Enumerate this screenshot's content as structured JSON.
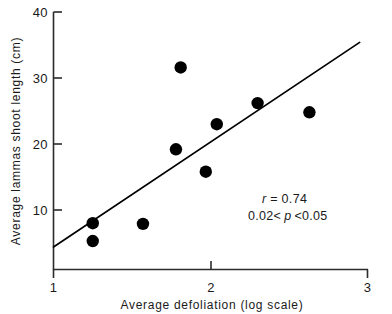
{
  "chart_data": {
    "type": "scatter",
    "title": "",
    "subtitle": "",
    "xlabel": "Average  defoliation  (log  scale)",
    "ylabel": "Average lammas shoot length (cm)",
    "xlim": [
      1,
      3
    ],
    "ylim": [
      0.9,
      40
    ],
    "xticks": [
      "1",
      "2",
      "3"
    ],
    "xtick_values": [
      1,
      2,
      3
    ],
    "yticks": [
      "40",
      "30",
      "20",
      "10"
    ],
    "ytick_values": [
      40,
      30,
      20,
      10
    ],
    "grid": false,
    "legend": null,
    "x_scale_note": "log scale",
    "points": [
      {
        "x": 1.25,
        "y": 8.0
      },
      {
        "x": 1.25,
        "y": 5.3
      },
      {
        "x": 1.57,
        "y": 7.9
      },
      {
        "x": 1.81,
        "y": 31.6
      },
      {
        "x": 1.78,
        "y": 19.2
      },
      {
        "x": 1.97,
        "y": 15.8
      },
      {
        "x": 2.04,
        "y": 23.0
      },
      {
        "x": 2.3,
        "y": 26.2
      },
      {
        "x": 2.63,
        "y": 24.8
      }
    ],
    "series": [
      {
        "name": "observations",
        "marker": "filled-circle",
        "color": "#000000",
        "values": [
          8.0,
          5.3,
          7.9,
          31.6,
          19.2,
          15.8,
          23.0,
          26.2,
          24.8
        ],
        "x": [
          1.25,
          1.25,
          1.57,
          1.81,
          1.78,
          1.97,
          2.04,
          2.3,
          2.63
        ]
      },
      {
        "name": "regression-line",
        "type": "line",
        "color": "#000000",
        "x": [
          1.0,
          2.95
        ],
        "values": [
          4.4,
          35.4
        ]
      }
    ],
    "annotations": [
      {
        "name": "correlation",
        "text": "r = 0.74"
      },
      {
        "name": "p-value",
        "text": "0.02< p <0.05"
      }
    ]
  },
  "annotation": {
    "r_symbol": "r",
    "r_rest": " = 0.74",
    "p_pre": "0.02<",
    "p_symbol": "p",
    "p_post": "<0.05"
  },
  "axes": {
    "x_title": "Average  defoliation  (log  scale)",
    "y_title": "Average lammas shoot length (cm)",
    "x_tick_labels": [
      "1",
      "2",
      "3"
    ],
    "y_tick_labels": [
      "40",
      "30",
      "20",
      "10"
    ]
  },
  "colors": {
    "ink": "#1a1a1a",
    "marker": "#000000",
    "axis": "#2b2b2b",
    "background": "#ffffff"
  }
}
